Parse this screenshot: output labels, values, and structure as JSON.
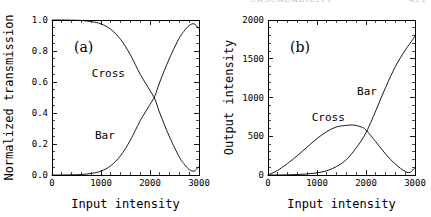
{
  "running_head": {
    "title": "CASCADABILITY",
    "page": "421"
  },
  "figure": {
    "width": 431,
    "height": 217,
    "background": "#ffffff",
    "ink_color": "#000000"
  },
  "chart_data": [
    {
      "type": "line",
      "panel_tag": "(a)",
      "title": "",
      "xlabel": "Input intensity",
      "ylabel": "Normalized transmission",
      "xlim": [
        0,
        3000
      ],
      "ylim": [
        0.0,
        1.0
      ],
      "grid": false,
      "legend": "inline-annotations",
      "xticks": [
        0,
        1000,
        2000,
        3000
      ],
      "xticklabels": [
        "0",
        "1000",
        "2000",
        "3000"
      ],
      "xminor_step": 200,
      "yticks": [
        0.0,
        0.2,
        0.4,
        0.6,
        0.8,
        1.0
      ],
      "yticklabels": [
        "0.0",
        "0.2",
        "0.4",
        "0.6",
        "0.8",
        "1.0"
      ],
      "yminor_step": 0.05,
      "annotations": [
        {
          "text": "Cross",
          "x": 1150,
          "y": 0.63
        },
        {
          "text": "Bar",
          "x": 1080,
          "y": 0.235
        }
      ],
      "series": [
        {
          "name": "Cross",
          "x": [
            0,
            200,
            400,
            600,
            800,
            1000,
            1200,
            1400,
            1600,
            1800,
            2000,
            2100,
            2200,
            2400,
            2600,
            2700,
            2800,
            2900,
            3000
          ],
          "values": [
            1.0,
            1.0,
            0.999,
            0.997,
            0.99,
            0.975,
            0.94,
            0.875,
            0.775,
            0.65,
            0.545,
            0.49,
            0.4,
            0.245,
            0.115,
            0.07,
            0.035,
            0.025,
            0.055
          ]
        },
        {
          "name": "Bar",
          "x": [
            0,
            200,
            400,
            600,
            800,
            1000,
            1200,
            1400,
            1600,
            1800,
            2000,
            2100,
            2200,
            2400,
            2600,
            2700,
            2800,
            2900,
            3000
          ],
          "values": [
            0.0,
            0.0,
            0.001,
            0.003,
            0.01,
            0.025,
            0.06,
            0.125,
            0.225,
            0.35,
            0.455,
            0.51,
            0.6,
            0.755,
            0.885,
            0.93,
            0.965,
            0.975,
            0.945
          ]
        }
      ]
    },
    {
      "type": "line",
      "panel_tag": "(b)",
      "title": "",
      "xlabel": "Input intensity",
      "ylabel": "Output intensity",
      "xlim": [
        0,
        3000
      ],
      "ylim": [
        0,
        2000
      ],
      "grid": false,
      "legend": "inline-annotations",
      "xticks": [
        0,
        1000,
        2000,
        3000
      ],
      "xticklabels": [
        "0",
        "1000",
        "2000",
        "3000"
      ],
      "xminor_step": 200,
      "yticks": [
        0,
        500,
        1000,
        1500,
        2000
      ],
      "yticklabels": [
        "0",
        "500",
        "1000",
        "1500",
        "2000"
      ],
      "yminor_step": 100,
      "annotations": [
        {
          "text": "Bar",
          "x": 2020,
          "y": 1030
        },
        {
          "text": "Cross",
          "x": 1230,
          "y": 700
        }
      ],
      "series": [
        {
          "name": "Cross",
          "x": [
            0,
            200,
            400,
            600,
            800,
            1000,
            1200,
            1400,
            1600,
            1750,
            1900,
            2000,
            2200,
            2400,
            2600,
            2800,
            2900,
            3000
          ],
          "values": [
            0,
            60,
            150,
            250,
            360,
            470,
            560,
            620,
            640,
            645,
            620,
            580,
            430,
            270,
            140,
            45,
            35,
            95
          ]
        },
        {
          "name": "Bar",
          "x": [
            0,
            200,
            400,
            600,
            800,
            1000,
            1200,
            1400,
            1600,
            1800,
            2000,
            2200,
            2400,
            2600,
            2800,
            2900,
            3000
          ],
          "values": [
            0,
            0,
            2,
            6,
            14,
            28,
            55,
            110,
            200,
            350,
            545,
            830,
            1130,
            1400,
            1610,
            1700,
            1790
          ]
        }
      ]
    }
  ]
}
